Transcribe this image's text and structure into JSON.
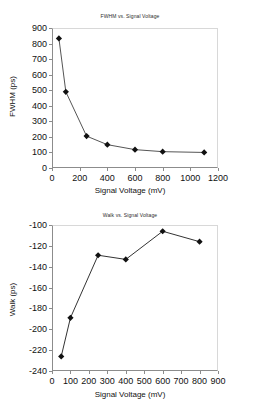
{
  "document": {
    "kind": "scanned-figure-page",
    "background_color": "#ffffff",
    "figure_count": 2
  },
  "chart_data": [
    {
      "id": "fwhm-vs-signal-voltage",
      "type": "line",
      "title": "FWHM vs. Signal Voltage",
      "xlabel": "Signal Voltage (mV)",
      "ylabel": "FWHM (ps)",
      "xlim": [
        0,
        1200
      ],
      "ylim": [
        0,
        900
      ],
      "xticks": [
        0,
        200,
        400,
        600,
        800,
        1000,
        1200
      ],
      "yticks": [
        0,
        100,
        200,
        300,
        400,
        500,
        600,
        700,
        800,
        900
      ],
      "xtick_labels": [
        "0",
        "200",
        "400",
        "600",
        "800",
        "1000",
        "1200"
      ],
      "ytick_labels": [
        "0",
        "100",
        "200",
        "300",
        "400",
        "500",
        "600",
        "700",
        "800",
        "900"
      ],
      "grid": false,
      "legend": null,
      "marker": "diamond",
      "marker_color": "#111111",
      "line_color": "#555555",
      "x": [
        50,
        100,
        250,
        400,
        600,
        800,
        1100
      ],
      "values": [
        833,
        490,
        205,
        150,
        118,
        105,
        100
      ],
      "points": [
        {
          "x": 50,
          "y": 833
        },
        {
          "x": 100,
          "y": 490
        },
        {
          "x": 250,
          "y": 205
        },
        {
          "x": 400,
          "y": 150
        },
        {
          "x": 600,
          "y": 118
        },
        {
          "x": 800,
          "y": 105
        },
        {
          "x": 1100,
          "y": 100
        }
      ]
    },
    {
      "id": "walk-vs-signal-voltage",
      "type": "line",
      "title": "Walk vs. Signal Voltage",
      "xlabel": "Signal Voltage (mV)",
      "ylabel": "Walk (ps)",
      "xlim": [
        0,
        900
      ],
      "ylim": [
        -240,
        -100
      ],
      "xticks": [
        0,
        100,
        200,
        300,
        400,
        500,
        600,
        700,
        800,
        900
      ],
      "yticks": [
        -240,
        -220,
        -200,
        -180,
        -160,
        -140,
        -120,
        -100
      ],
      "xtick_labels": [
        "0",
        "100",
        "200",
        "300",
        "400",
        "500",
        "600",
        "700",
        "800",
        "900"
      ],
      "ytick_labels": [
        "-240",
        "-220",
        "-200",
        "-180",
        "-160",
        "-140",
        "-120",
        "-100"
      ],
      "grid": false,
      "legend": null,
      "marker": "diamond",
      "marker_color": "#111111",
      "line_color": "#333333",
      "x": [
        50,
        100,
        250,
        400,
        600,
        800
      ],
      "values": [
        -226,
        -189,
        -129,
        -133,
        -106,
        -116
      ],
      "points": [
        {
          "x": 50,
          "y": -226
        },
        {
          "x": 100,
          "y": -189
        },
        {
          "x": 250,
          "y": -129
        },
        {
          "x": 400,
          "y": -133
        },
        {
          "x": 600,
          "y": -106
        },
        {
          "x": 800,
          "y": -116
        }
      ]
    }
  ]
}
